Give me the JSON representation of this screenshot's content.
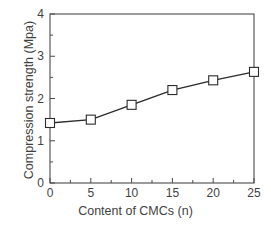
{
  "chart_data": {
    "type": "line",
    "title": "",
    "xlabel": "Content of CMCs (n)",
    "ylabel": "Compression strength (Mpa)",
    "x": [
      0,
      5,
      10,
      15,
      20,
      25
    ],
    "values": [
      1.42,
      1.5,
      1.85,
      2.2,
      2.43,
      2.63
    ],
    "series": [
      {
        "name": "Compression strength",
        "x": [
          0,
          5,
          10,
          15,
          20,
          25
        ],
        "values": [
          1.42,
          1.5,
          1.85,
          2.2,
          2.43,
          2.63
        ],
        "marker": "open-square",
        "line_color": "#2b2b2b",
        "marker_fill": "#ffffff"
      }
    ],
    "xlim": [
      0,
      25
    ],
    "ylim": [
      0,
      4
    ],
    "xticks": [
      0,
      5,
      10,
      15,
      20,
      25
    ],
    "yticks": [
      0,
      1,
      2,
      3,
      4
    ],
    "xtick_labels": [
      "0",
      "5",
      "10",
      "15",
      "20",
      "25"
    ],
    "ytick_labels": [
      "0",
      "1",
      "2",
      "3",
      "4"
    ],
    "grid": false,
    "legend": null,
    "frame": "box",
    "tick_direction": "in",
    "axis_color": "#4a4a4a"
  },
  "labels": {
    "x_axis_title": "Content of CMCs (n)",
    "y_axis_title": "Compression strength (Mpa)",
    "xticks": [
      "0",
      "5",
      "10",
      "15",
      "20",
      "25"
    ],
    "yticks": [
      "0",
      "1",
      "2",
      "3",
      "4"
    ]
  }
}
